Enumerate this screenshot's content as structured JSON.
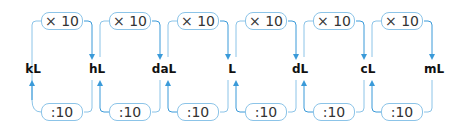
{
  "diagram": {
    "units": [
      "kL",
      "hL",
      "daL",
      "L",
      "dL",
      "cL",
      "mL"
    ],
    "multiply_label": "× 10",
    "divide_label": ":10",
    "colors": {
      "line": "#8cc4e8",
      "arrow": "#3a9ad9",
      "text": "#111111"
    },
    "steps": [
      {
        "from": "kL",
        "to": "hL",
        "top": "× 10",
        "bottom": ":10"
      },
      {
        "from": "hL",
        "to": "daL",
        "top": "× 10",
        "bottom": ":10"
      },
      {
        "from": "daL",
        "to": "L",
        "top": "× 10",
        "bottom": ":10"
      },
      {
        "from": "L",
        "to": "dL",
        "top": "× 10",
        "bottom": ":10"
      },
      {
        "from": "dL",
        "to": "cL",
        "top": "× 10",
        "bottom": ":10"
      },
      {
        "from": "cL",
        "to": "mL",
        "top": "× 10",
        "bottom": ":10"
      }
    ]
  }
}
